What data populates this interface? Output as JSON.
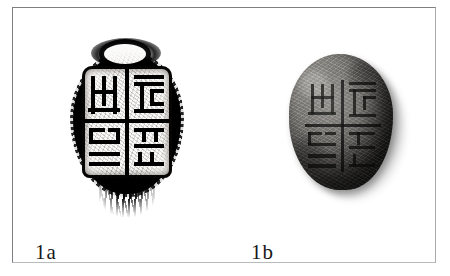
{
  "figure": {
    "type": "archaeological-artifact-plate",
    "medium": "black-and-white halftone print",
    "border_color": "#8e9094",
    "background_color": "#ffffff",
    "panel_count": 2
  },
  "panels": [
    {
      "id": "1a",
      "caption": "1a",
      "view": "ink impression / rubbing of seal face",
      "subject": "ancient Chinese seal",
      "tone": "high-contrast black on white",
      "shape": "oval",
      "layout": "four quadrants divided by a cross",
      "features": [
        "oval knob loop at top",
        "ragged inked rim",
        "four seal-script characters",
        "tassel fringe at bottom"
      ],
      "ink_color": "#141312",
      "field_color": "#f2f0ed"
    },
    {
      "id": "1b",
      "caption": "1b",
      "view": "photograph of the physical seal object",
      "subject": "ancient Chinese seal",
      "tone": "grey stone / clay, lit from upper left",
      "shape": "oval",
      "layout": "four quadrants divided by an incised cross",
      "features": [
        "cast shadow to the lower right",
        "worn pitted surface",
        "incised seal-script characters"
      ],
      "body_color": "#827f7b",
      "incision_color": "#0e0d0c"
    }
  ],
  "captions": {
    "left": "1a",
    "right": "1b"
  }
}
